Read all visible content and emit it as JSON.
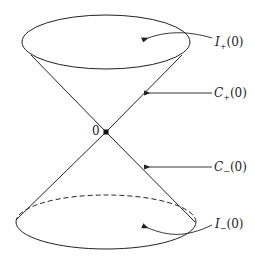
{
  "diagram": {
    "type": "light-cone",
    "apex_label": "0",
    "labels": {
      "future_interior": {
        "main": "I",
        "sub": "+",
        "arg": "(0)"
      },
      "future_cone": {
        "main": "C",
        "sub": "+",
        "arg": "(0)"
      },
      "past_cone": {
        "main": "C",
        "sub": "−",
        "arg": "(0)"
      },
      "past_interior": {
        "main": "I",
        "sub": "−",
        "arg": "(0)"
      }
    },
    "colors": {
      "stroke": "#222222",
      "background": "#ffffff"
    }
  }
}
